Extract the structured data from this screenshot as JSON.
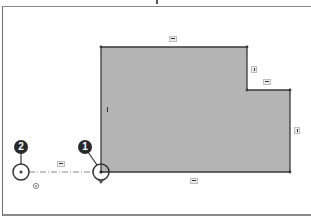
{
  "sketch": {
    "profile_fill": "#b4b4b4",
    "line_color": "#3a3a3a",
    "profile_points": [
      [
        101,
        47
      ],
      [
        247,
        47
      ],
      [
        247,
        90
      ],
      [
        290,
        90
      ],
      [
        290,
        172
      ],
      [
        101,
        172
      ]
    ],
    "relations": [
      {
        "id": "top-edge-horizontal",
        "type": "horizontal"
      },
      {
        "id": "step-vertical",
        "type": "vertical"
      },
      {
        "id": "step-horizontal",
        "type": "horizontal"
      },
      {
        "id": "right-edge-vertical",
        "type": "vertical"
      },
      {
        "id": "bottom-edge-horizontal",
        "type": "horizontal"
      },
      {
        "id": "left-edge-vertical",
        "type": "vertical"
      },
      {
        "id": "construction-line-horizontal",
        "type": "horizontal"
      }
    ]
  },
  "callouts": [
    {
      "label": "1",
      "target": "sketch-corner-point"
    },
    {
      "label": "2",
      "target": "origin-point"
    }
  ],
  "icons": {
    "coincident": "coincident-icon",
    "origin": "origin-icon"
  }
}
